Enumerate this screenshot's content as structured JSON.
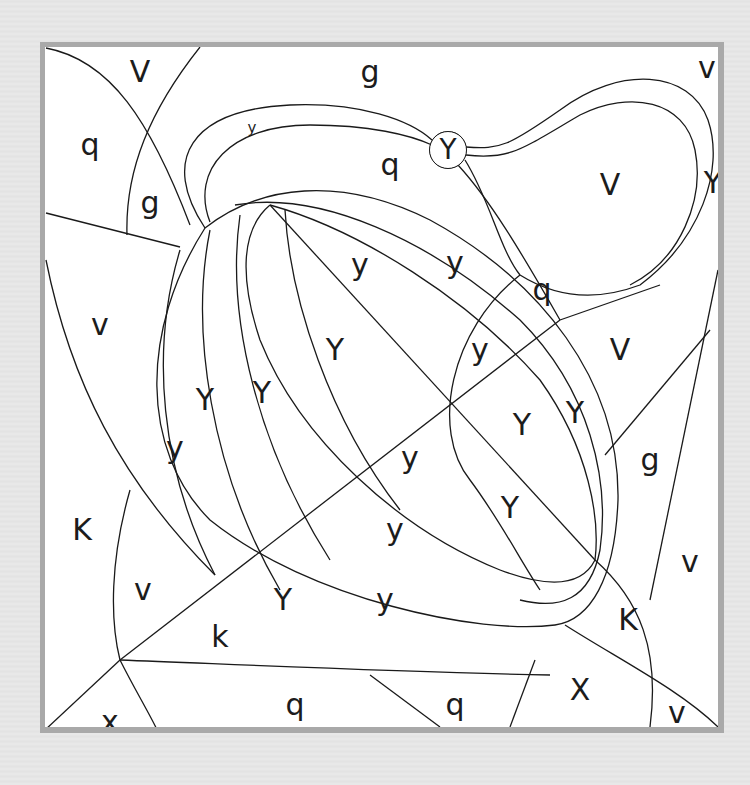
{
  "puzzle": {
    "type": "color-by-letter",
    "frame_color": "#a9a9a9",
    "paper_color": "#ffffff",
    "line_color": "#1a1a1a",
    "labels": [
      {
        "id": "r1",
        "letter": "V",
        "x": 140,
        "y": 72
      },
      {
        "id": "r2",
        "letter": "g",
        "x": 370,
        "y": 72
      },
      {
        "id": "r3",
        "letter": "v",
        "x": 707,
        "y": 68
      },
      {
        "id": "r4",
        "letter": "q",
        "x": 90,
        "y": 145
      },
      {
        "id": "r5",
        "letter": "y",
        "x": 252,
        "y": 128,
        "size": "small"
      },
      {
        "id": "r6",
        "letter": "Y",
        "x": 448,
        "y": 150,
        "style": "circled"
      },
      {
        "id": "r7",
        "letter": "q",
        "x": 390,
        "y": 165
      },
      {
        "id": "r8",
        "letter": "V",
        "x": 610,
        "y": 185
      },
      {
        "id": "r9",
        "letter": "Y",
        "x": 713,
        "y": 183
      },
      {
        "id": "r10",
        "letter": "g",
        "x": 150,
        "y": 203
      },
      {
        "id": "r11",
        "letter": "y",
        "x": 360,
        "y": 265
      },
      {
        "id": "r12",
        "letter": "y",
        "x": 455,
        "y": 263
      },
      {
        "id": "r13",
        "letter": "q",
        "x": 542,
        "y": 290
      },
      {
        "id": "r14",
        "letter": "v",
        "x": 100,
        "y": 325
      },
      {
        "id": "r15",
        "letter": "Y",
        "x": 335,
        "y": 350
      },
      {
        "id": "r16",
        "letter": "y",
        "x": 480,
        "y": 350
      },
      {
        "id": "r17",
        "letter": "V",
        "x": 620,
        "y": 350
      },
      {
        "id": "r18",
        "letter": "Y",
        "x": 205,
        "y": 400
      },
      {
        "id": "r19",
        "letter": "Y",
        "x": 262,
        "y": 393
      },
      {
        "id": "r20",
        "letter": "Y",
        "x": 575,
        "y": 413
      },
      {
        "id": "r21",
        "letter": "Y",
        "x": 522,
        "y": 425
      },
      {
        "id": "r22",
        "letter": "y",
        "x": 175,
        "y": 448
      },
      {
        "id": "r23",
        "letter": "y",
        "x": 410,
        "y": 458
      },
      {
        "id": "r24",
        "letter": "g",
        "x": 650,
        "y": 460
      },
      {
        "id": "r25",
        "letter": "Y",
        "x": 510,
        "y": 508
      },
      {
        "id": "r26",
        "letter": "K",
        "x": 82,
        "y": 530
      },
      {
        "id": "r27",
        "letter": "y",
        "x": 395,
        "y": 530
      },
      {
        "id": "r28",
        "letter": "v",
        "x": 690,
        "y": 562
      },
      {
        "id": "r29",
        "letter": "v",
        "x": 143,
        "y": 590
      },
      {
        "id": "r30",
        "letter": "Y",
        "x": 283,
        "y": 600
      },
      {
        "id": "r31",
        "letter": "y",
        "x": 385,
        "y": 600
      },
      {
        "id": "r32",
        "letter": "K",
        "x": 628,
        "y": 620
      },
      {
        "id": "r33",
        "letter": "k",
        "x": 220,
        "y": 637
      },
      {
        "id": "r34",
        "letter": "X",
        "x": 580,
        "y": 690
      },
      {
        "id": "r35",
        "letter": "q",
        "x": 295,
        "y": 705
      },
      {
        "id": "r36",
        "letter": "q",
        "x": 455,
        "y": 705
      },
      {
        "id": "r37",
        "letter": "x",
        "x": 110,
        "y": 722
      },
      {
        "id": "r38",
        "letter": "v",
        "x": 677,
        "y": 713
      }
    ]
  }
}
